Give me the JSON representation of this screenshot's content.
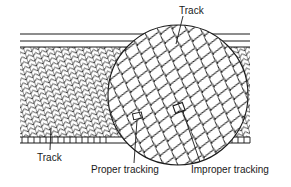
{
  "diagram": {
    "labels": {
      "track_top": "Track",
      "track_bottom": "Track",
      "proper_tracking": "Proper tracking",
      "improper_tracking": "Improper tracking"
    },
    "colors": {
      "ink": "#1a1a1a",
      "background": "#ffffff"
    },
    "elements": [
      "guard-band-lines",
      "helical-track-pattern",
      "magnified-circle",
      "control-track-comb",
      "proper-tracking-marker",
      "improper-tracking-marker"
    ]
  }
}
